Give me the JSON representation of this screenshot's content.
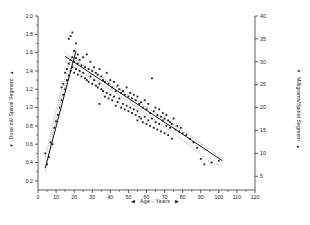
{
  "figure": {
    "background": "#ffffff",
    "ink": "#1a1a1a",
    "caption": ""
  },
  "axes": {
    "left": {
      "title": "Dose ml/ Spinal Segment",
      "arrow_top": "▲",
      "arrow_bottom": "▼",
      "ticks": [
        "0.2",
        "0.4",
        "0.6",
        "0.8",
        "1.0",
        "1.2",
        "1.4",
        "1.6",
        "1.8",
        "2.0"
      ]
    },
    "right": {
      "title": "Milligrams/Spinal Segment",
      "arrow_top": "▲",
      "arrow_bottom": "▼",
      "ticks": [
        "5",
        "10",
        "15",
        "20",
        "25",
        "30",
        "35",
        "40"
      ]
    },
    "bottom": {
      "title": "Age - Years",
      "arrow_left": "◀",
      "arrow_right": "▶",
      "ticks": [
        "0",
        "10",
        "20",
        "30",
        "40",
        "50",
        "60",
        "70",
        "80",
        "90",
        "100",
        "110",
        "120"
      ]
    }
  },
  "chart_data": {
    "type": "scatter",
    "title": "",
    "xlabel": "Age - Years",
    "ylabel": "Dose ml/ Spinal Segment",
    "y2label": "Milligrams/Spinal Segment",
    "xlim": [
      0,
      120
    ],
    "ylim": [
      0.1,
      2.0
    ],
    "y2lim": [
      2.0,
      40.0
    ],
    "y2_per_y1": 20,
    "grid": false,
    "legend": null,
    "marker": "filled-square",
    "marker_size_px": 1.8,
    "series": [
      {
        "name": "Dose per spinal segment",
        "x": [
          4,
          5,
          6,
          7,
          8,
          9,
          10,
          11,
          12,
          13,
          13,
          14,
          14,
          15,
          15,
          16,
          16,
          17,
          17,
          17,
          18,
          18,
          18,
          19,
          19,
          19,
          20,
          20,
          20,
          21,
          21,
          21,
          22,
          22,
          22,
          23,
          23,
          24,
          24,
          25,
          25,
          26,
          26,
          27,
          27,
          28,
          28,
          29,
          29,
          30,
          30,
          31,
          31,
          32,
          32,
          33,
          33,
          34,
          34,
          34,
          35,
          35,
          36,
          36,
          37,
          37,
          38,
          38,
          39,
          39,
          40,
          40,
          41,
          41,
          42,
          42,
          43,
          43,
          44,
          44,
          45,
          45,
          46,
          46,
          47,
          47,
          48,
          48,
          49,
          49,
          50,
          50,
          51,
          51,
          52,
          52,
          53,
          53,
          54,
          54,
          55,
          55,
          55,
          56,
          56,
          57,
          57,
          58,
          58,
          59,
          59,
          60,
          60,
          61,
          61,
          62,
          62,
          63,
          63,
          64,
          64,
          65,
          65,
          66,
          66,
          67,
          67,
          68,
          68,
          69,
          69,
          70,
          70,
          71,
          71,
          72,
          72,
          73,
          73,
          74,
          74,
          75,
          76,
          77,
          78,
          79,
          80,
          82,
          84,
          86,
          88,
          90,
          92,
          96,
          100
        ],
        "y": [
          0.5,
          0.38,
          0.46,
          0.62,
          0.6,
          0.78,
          0.85,
          0.92,
          1.0,
          1.08,
          1.22,
          1.14,
          1.26,
          1.2,
          1.38,
          1.3,
          1.42,
          1.35,
          1.48,
          1.75,
          1.4,
          1.52,
          1.78,
          1.44,
          1.55,
          1.82,
          1.38,
          1.5,
          1.62,
          1.42,
          1.54,
          1.7,
          1.36,
          1.48,
          1.58,
          1.4,
          1.52,
          1.34,
          1.46,
          1.38,
          1.55,
          1.32,
          1.44,
          1.3,
          1.58,
          1.28,
          1.42,
          1.34,
          1.5,
          1.26,
          1.4,
          1.3,
          1.44,
          1.24,
          1.38,
          1.22,
          1.36,
          1.04,
          1.26,
          1.42,
          1.2,
          1.34,
          1.18,
          1.3,
          1.12,
          1.28,
          1.16,
          1.38,
          1.1,
          1.26,
          1.14,
          1.3,
          1.08,
          1.22,
          1.12,
          1.28,
          1.02,
          1.18,
          1.06,
          1.24,
          1.1,
          1.2,
          1.0,
          1.16,
          1.04,
          1.18,
          0.98,
          1.14,
          1.02,
          1.22,
          0.96,
          1.12,
          1.0,
          1.16,
          0.94,
          1.1,
          0.98,
          1.14,
          0.92,
          1.08,
          0.86,
          0.96,
          1.12,
          0.9,
          1.04,
          0.88,
          1.06,
          0.84,
          1.0,
          0.9,
          1.08,
          0.82,
          0.98,
          0.86,
          1.04,
          0.8,
          0.94,
          0.88,
          1.32,
          0.78,
          0.96,
          0.84,
          1.0,
          0.76,
          0.92,
          0.82,
          0.98,
          0.74,
          0.9,
          0.86,
          0.94,
          0.72,
          0.88,
          0.8,
          0.92,
          0.7,
          0.86,
          0.78,
          0.84,
          0.66,
          0.82,
          0.88,
          0.76,
          0.8,
          0.74,
          0.78,
          0.72,
          0.7,
          0.66,
          0.62,
          0.56,
          0.44,
          0.38,
          0.4,
          0.42
        ]
      }
    ],
    "fits": [
      {
        "name": "rising-segment",
        "type": "line",
        "x": [
          4,
          21
        ],
        "y": [
          0.34,
          1.62
        ],
        "style": "solid"
      },
      {
        "name": "declining-segment",
        "type": "line",
        "x": [
          15,
          102
        ],
        "y": [
          1.56,
          0.42
        ],
        "style": "solid"
      }
    ],
    "bands": [
      {
        "name": "rising-confidence-band",
        "style": "dotted",
        "x": [
          4,
          8,
          12,
          16,
          20,
          21
        ],
        "upper": [
          0.44,
          0.8,
          1.12,
          1.4,
          1.62,
          1.66
        ],
        "lower": [
          0.3,
          0.7,
          1.02,
          1.3,
          1.54,
          1.58
        ]
      },
      {
        "name": "declining-confidence-band",
        "style": "dotted",
        "x": [
          15,
          25,
          35,
          45,
          55,
          65,
          75,
          85,
          95,
          102
        ],
        "upper": [
          1.6,
          1.46,
          1.33,
          1.2,
          1.07,
          0.94,
          0.81,
          0.68,
          0.54,
          0.45
        ],
        "lower": [
          1.5,
          1.38,
          1.26,
          1.13,
          1.0,
          0.86,
          0.72,
          0.57,
          0.41,
          0.36
        ]
      }
    ]
  }
}
